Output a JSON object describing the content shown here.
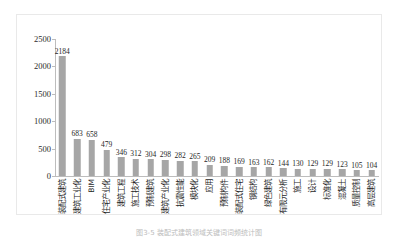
{
  "chart_data": {
    "type": "bar",
    "title": "",
    "xlabel": "",
    "ylabel": "",
    "ylim": [
      0,
      2500
    ],
    "yticks": [
      0,
      500,
      1000,
      1500,
      2000,
      2500
    ],
    "grid": false,
    "legend": null,
    "orientation": "vertical",
    "bar_color": "#a6a6a6",
    "categories": [
      "装配式建筑",
      "建筑工业化",
      "BIM",
      "住宅产业化",
      "建筑工程",
      "施工技术",
      "预制建筑",
      "建筑产业化",
      "抗震性能",
      "模块化",
      "应用",
      "预制构件",
      "装配式住宅",
      "钢结构",
      "绿色建筑",
      "有限元分析",
      "施工",
      "设计",
      "标准化",
      "混凝土",
      "质量控制",
      "高层建筑"
    ],
    "values": [
      2184,
      683,
      658,
      479,
      346,
      312,
      304,
      298,
      282,
      265,
      209,
      188,
      169,
      163,
      162,
      144,
      130,
      129,
      129,
      123,
      105,
      104
    ]
  },
  "caption": {
    "text": "图3-5 装配式建筑领域关键词词频统计图"
  },
  "axis": {
    "y_max_label": "2500",
    "y_min_label": "0"
  }
}
